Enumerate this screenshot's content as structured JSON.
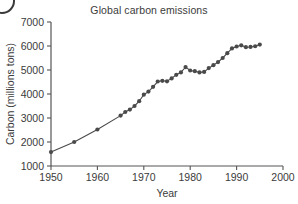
{
  "chart_data": {
    "type": "line",
    "title": "Global carbon emissions",
    "xlabel": "Year",
    "ylabel": "Carbon (millions tons)",
    "xlim": [
      1950,
      2000
    ],
    "ylim": [
      1000,
      7000
    ],
    "xticks": [
      1950,
      1960,
      1970,
      1980,
      1990,
      2000
    ],
    "yticks": [
      1000,
      2000,
      3000,
      4000,
      5000,
      6000,
      7000
    ],
    "grid": false,
    "legend": null,
    "marker": "filled-circle",
    "series": [
      {
        "name": "Global carbon emissions",
        "color": "#4a4a4a",
        "x": [
          1950,
          1955,
          1960,
          1965,
          1966,
          1967,
          1968,
          1969,
          1970,
          1971,
          1972,
          1973,
          1974,
          1975,
          1976,
          1977,
          1978,
          1979,
          1980,
          1981,
          1982,
          1983,
          1984,
          1985,
          1986,
          1987,
          1988,
          1989,
          1990,
          1991,
          1992,
          1993,
          1994,
          1995
        ],
        "values": [
          1580,
          2000,
          2520,
          3100,
          3250,
          3350,
          3500,
          3700,
          3970,
          4100,
          4300,
          4520,
          4550,
          4530,
          4650,
          4800,
          4900,
          5120,
          4980,
          4950,
          4900,
          4920,
          5080,
          5200,
          5330,
          5500,
          5700,
          5900,
          5980,
          6030,
          5950,
          5960,
          5990,
          6060
        ]
      }
    ]
  },
  "corner": {
    "badge_name": "cropped-circle-badge"
  }
}
